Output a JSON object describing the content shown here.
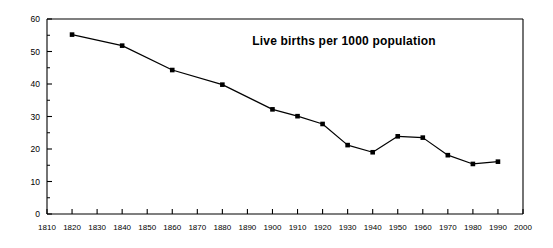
{
  "chart_data": {
    "type": "line",
    "title": "Live births per 1000 population",
    "xlabel": "",
    "ylabel": "",
    "xlim": [
      1810,
      2000
    ],
    "ylim": [
      0,
      60
    ],
    "grid": false,
    "legend": "none",
    "marker": "square",
    "marker_color": "#000000",
    "line_color": "#000000",
    "x": [
      1820,
      1840,
      1860,
      1880,
      1900,
      1910,
      1920,
      1930,
      1940,
      1950,
      1960,
      1970,
      1980,
      1990
    ],
    "values": [
      55.2,
      51.8,
      44.3,
      39.8,
      32.2,
      30.1,
      27.7,
      21.2,
      19.0,
      23.9,
      23.5,
      18.1,
      15.4,
      16.1
    ],
    "series": [
      {
        "name": "Live births per 1000 population",
        "x": [
          1820,
          1840,
          1860,
          1880,
          1900,
          1910,
          1920,
          1930,
          1940,
          1950,
          1960,
          1970,
          1980,
          1990
        ],
        "values": [
          55.2,
          51.8,
          44.3,
          39.8,
          32.2,
          30.1,
          27.7,
          21.2,
          19.0,
          23.9,
          23.5,
          18.1,
          15.4,
          16.1
        ]
      }
    ],
    "xticks": [
      1810,
      1820,
      1830,
      1840,
      1850,
      1860,
      1870,
      1880,
      1890,
      1900,
      1910,
      1920,
      1930,
      1940,
      1950,
      1960,
      1970,
      1980,
      1990,
      2000
    ],
    "xtick_labels": [
      "1810",
      "1820",
      "1830",
      "1840",
      "1850",
      "1860",
      "1870",
      "1880",
      "1890",
      "1900",
      "1910",
      "1920",
      "1930",
      "1940",
      "1950",
      "1960",
      "1970",
      "1980",
      "1990",
      "2000"
    ],
    "yticks": [
      0,
      10,
      20,
      30,
      40,
      50,
      60
    ],
    "ytick_labels": [
      "0",
      "10",
      "20",
      "30",
      "40",
      "50",
      "60"
    ],
    "yminor_ticks": [
      5,
      15,
      25,
      35,
      45,
      55
    ]
  }
}
